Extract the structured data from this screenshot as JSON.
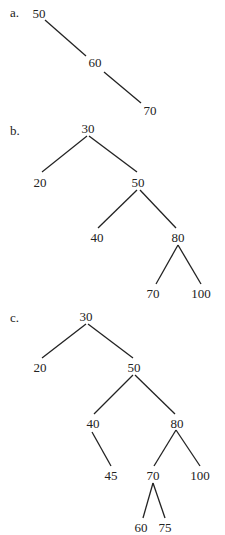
{
  "parts": [
    {
      "label": "a.",
      "nodes": {
        "n50": "50",
        "n60": "60",
        "n70": "70"
      }
    },
    {
      "label": "b.",
      "nodes": {
        "n30": "30",
        "n20": "20",
        "n50": "50",
        "n40": "40",
        "n80": "80",
        "n70": "70",
        "n100": "100"
      }
    },
    {
      "label": "c.",
      "nodes": {
        "n30": "30",
        "n20": "20",
        "n50": "50",
        "n40": "40",
        "n80": "80",
        "n45": "45",
        "n70": "70",
        "n100": "100",
        "n60": "60",
        "n75": "75"
      }
    }
  ]
}
